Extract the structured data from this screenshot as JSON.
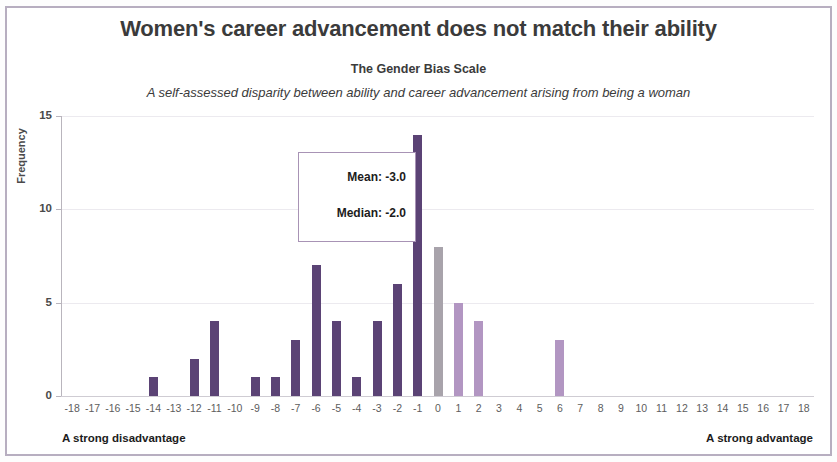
{
  "figure": {
    "title": "Women's career advancement does not match their ability",
    "subtitle": "The Gender Bias Scale",
    "description": "A self-assessed disparity between ability and career advancement arising from being a woman",
    "footer_left": "A strong disadvantage",
    "footer_right": "A strong advantage"
  },
  "annotation": {
    "mean": "Mean: -3.0",
    "median": "Median: -2.0"
  },
  "colors": {
    "bar_negative": "#5b4375",
    "bar_zero": "#a8a3ab",
    "bar_positive": "#b296c2",
    "border": "#b7aec0",
    "gridline": "#eceaef",
    "axis": "#b9b5bd",
    "text": "#3b3b3b"
  },
  "chart_data": {
    "type": "bar",
    "title": "Women's career advancement does not match their ability",
    "subtitle": "The Gender Bias Scale",
    "annotation_text": "A self-assessed disparity between ability and career advancement arising from being a woman",
    "xlabel": "",
    "ylabel": "Frequency",
    "xlim": [
      -18.5,
      18.5
    ],
    "ylim": [
      0,
      15
    ],
    "yticks": [
      0,
      5,
      10,
      15
    ],
    "ytick_labels": [
      "0",
      "5",
      "10",
      "15"
    ],
    "grid": true,
    "legend": false,
    "categories": [
      -18,
      -17,
      -16,
      -15,
      -14,
      -13,
      -12,
      -11,
      -10,
      -9,
      -8,
      -7,
      -6,
      -5,
      -4,
      -3,
      -2,
      -1,
      0,
      1,
      2,
      3,
      4,
      5,
      6,
      7,
      8,
      9,
      10,
      11,
      12,
      13,
      14,
      15,
      16,
      17,
      18
    ],
    "values": [
      0,
      0,
      0,
      0,
      1,
      0,
      2,
      4,
      0,
      1,
      1,
      3,
      7,
      4,
      1,
      4,
      6,
      14,
      8,
      5,
      4,
      0,
      0,
      0,
      3,
      0,
      0,
      0,
      0,
      0,
      0,
      0,
      0,
      0,
      0,
      0,
      0
    ],
    "bar_colors": [
      "#5b4375",
      "#5b4375",
      "#5b4375",
      "#5b4375",
      "#5b4375",
      "#5b4375",
      "#5b4375",
      "#5b4375",
      "#5b4375",
      "#5b4375",
      "#5b4375",
      "#5b4375",
      "#5b4375",
      "#5b4375",
      "#5b4375",
      "#5b4375",
      "#5b4375",
      "#5b4375",
      "#a8a3ab",
      "#b296c2",
      "#b296c2",
      "#b296c2",
      "#b296c2",
      "#b296c2",
      "#b296c2",
      "#b296c2",
      "#b296c2",
      "#b296c2",
      "#b296c2",
      "#b296c2",
      "#b296c2",
      "#b296c2",
      "#b296c2",
      "#b296c2",
      "#b296c2",
      "#b296c2",
      "#b296c2"
    ],
    "xtick_labels": [
      "-18",
      "-17",
      "-16",
      "-15",
      "-14",
      "-13",
      "-12",
      "-11",
      "-10",
      "-9",
      "-8",
      "-7",
      "-6",
      "-5",
      "-4",
      "-3",
      "-2",
      "-1",
      "0",
      "1",
      "2",
      "3",
      "4",
      "5",
      "6",
      "7",
      "8",
      "9",
      "10",
      "11",
      "12",
      "13",
      "14",
      "15",
      "16",
      "17",
      "18"
    ],
    "annotations": [
      "Mean: -3.0",
      "Median: -2.0"
    ]
  }
}
